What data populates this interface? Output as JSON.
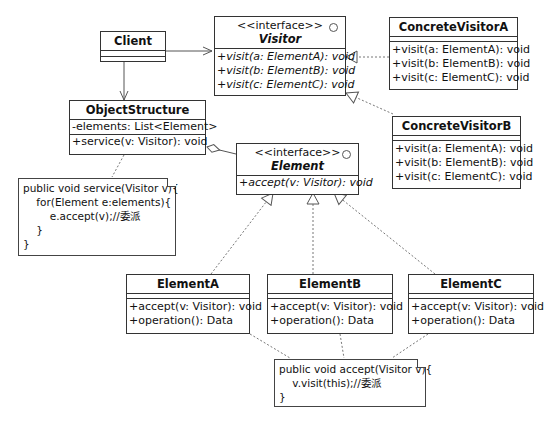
{
  "classes": {
    "client": {
      "name": "Client"
    },
    "visitor": {
      "stereotype": "<<interface>>",
      "name": "Visitor",
      "methods": [
        "+visit(a: ElementA): void",
        "+visit(b: ElementB): void",
        "+visit(c: ElementC): void"
      ]
    },
    "concrete_visitor_a": {
      "name": "ConcreteVisitorA",
      "methods": [
        "+visit(a: ElementA): void",
        "+visit(b: ElementB): void",
        "+visit(c: ElementC): void"
      ]
    },
    "concrete_visitor_b": {
      "name": "ConcreteVisitorB",
      "methods": [
        "+visit(a: ElementA): void",
        "+visit(b: ElementB): void",
        "+visit(c: ElementC): void"
      ]
    },
    "object_structure": {
      "name": "ObjectStructure",
      "attributes": [
        "-elements: List<Element>"
      ],
      "methods": [
        "+service(v: Visitor): void"
      ]
    },
    "element": {
      "stereotype": "<<interface>>",
      "name": "Element",
      "methods": [
        "+accept(v: Visitor): void"
      ]
    },
    "element_a": {
      "name": "ElementA",
      "methods": [
        "+accept(v: Visitor): void",
        "+operation(): Data"
      ]
    },
    "element_b": {
      "name": "ElementB",
      "methods": [
        "+accept(v: Visitor): void",
        "+operation(): Data"
      ]
    },
    "element_c": {
      "name": "ElementC",
      "methods": [
        "+accept(v: Visitor): void",
        "+operation(): Data"
      ]
    }
  },
  "notes": {
    "service_note": "public void service(Visitor v){\n    for(Element e:elements){\n        e.accept(v);//委派\n    }\n}",
    "accept_note": "public void accept(Visitor v){\n    v.visit(this);//委派\n}"
  },
  "relations": [
    {
      "from": "Client",
      "to": "Visitor",
      "type": "association"
    },
    {
      "from": "Client",
      "to": "ObjectStructure",
      "type": "association"
    },
    {
      "from": "ConcreteVisitorA",
      "to": "Visitor",
      "type": "realization"
    },
    {
      "from": "ConcreteVisitorB",
      "to": "Visitor",
      "type": "realization"
    },
    {
      "from": "ObjectStructure",
      "to": "Element",
      "type": "aggregation"
    },
    {
      "from": "ElementA",
      "to": "Element",
      "type": "realization"
    },
    {
      "from": "ElementB",
      "to": "Element",
      "type": "realization"
    },
    {
      "from": "ElementC",
      "to": "Element",
      "type": "realization"
    }
  ]
}
